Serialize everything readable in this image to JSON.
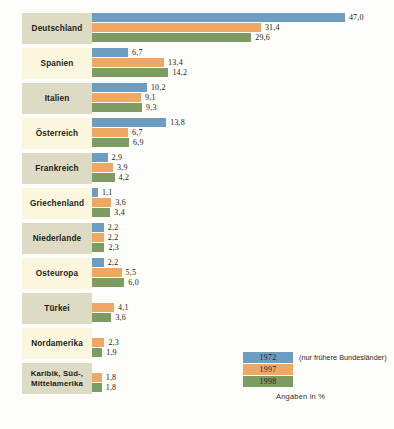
{
  "chart_data": {
    "type": "bar",
    "orientation": "horizontal",
    "title": "",
    "xlabel": "",
    "ylabel": "",
    "unit_note": "Angaben in %",
    "legend_position": "bottom-right",
    "grid": false,
    "xlim": [
      0,
      47
    ],
    "categories": [
      "Deutschland",
      "Spanien",
      "Italien",
      "Österreich",
      "Frankreich",
      "Griechenland",
      "Niederlande",
      "Osteuropa",
      "Türkei",
      "Nordamerika",
      "Karibik, Süd-, Mittelamerika"
    ],
    "series": [
      {
        "name": "1972",
        "color": "#6e9dc2",
        "values": [
          47.0,
          6.7,
          10.2,
          13.8,
          2.9,
          1.1,
          2.2,
          2.2,
          null,
          null,
          null
        ],
        "labels": [
          "47,0",
          "6,7",
          "10,2",
          "13,8",
          "2,9",
          "1,1",
          "2,2",
          "2,2",
          "",
          "",
          ""
        ]
      },
      {
        "name": "1997",
        "color": "#efa863",
        "values": [
          31.4,
          13.4,
          9.1,
          6.7,
          3.9,
          3.6,
          2.2,
          5.5,
          4.1,
          2.3,
          1.8
        ],
        "labels": [
          "31,4",
          "13,4",
          "9,1",
          "6,7",
          "3,9",
          "3,6",
          "2,2",
          "5,5",
          "4,1",
          "2,3",
          "1,8"
        ]
      },
      {
        "name": "1998",
        "color": "#7d9c62",
        "values": [
          29.6,
          14.2,
          9.3,
          6.9,
          4.2,
          3.4,
          2.3,
          6.0,
          3.6,
          1.9,
          1.8
        ],
        "labels": [
          "29,6",
          "14,2",
          "9,3",
          "6,9",
          "4,2",
          "3,4",
          "2,3",
          "6,0",
          "3,6",
          "1,9",
          "1,8"
        ]
      }
    ]
  },
  "rows": [
    {
      "label": "Deutschland",
      "two_line": false,
      "bars": [
        {
          "series": "1972",
          "value": 47.0,
          "label": "47,0"
        },
        {
          "series": "1997",
          "value": 31.4,
          "label": "31,4"
        },
        {
          "series": "1998",
          "value": 29.6,
          "label": "29,6"
        }
      ]
    },
    {
      "label": "Spanien",
      "two_line": false,
      "bars": [
        {
          "series": "1972",
          "value": 6.7,
          "label": "6,7"
        },
        {
          "series": "1997",
          "value": 13.4,
          "label": "13,4"
        },
        {
          "series": "1998",
          "value": 14.2,
          "label": "14,2"
        }
      ]
    },
    {
      "label": "Italien",
      "two_line": false,
      "bars": [
        {
          "series": "1972",
          "value": 10.2,
          "label": "10,2"
        },
        {
          "series": "1997",
          "value": 9.1,
          "label": "9,1"
        },
        {
          "series": "1998",
          "value": 9.3,
          "label": "9,3"
        }
      ]
    },
    {
      "label": "Österreich",
      "two_line": false,
      "bars": [
        {
          "series": "1972",
          "value": 13.8,
          "label": "13,8"
        },
        {
          "series": "1997",
          "value": 6.7,
          "label": "6,7"
        },
        {
          "series": "1998",
          "value": 6.9,
          "label": "6,9"
        }
      ]
    },
    {
      "label": "Frankreich",
      "two_line": false,
      "bars": [
        {
          "series": "1972",
          "value": 2.9,
          "label": "2,9"
        },
        {
          "series": "1997",
          "value": 3.9,
          "label": "3,9"
        },
        {
          "series": "1998",
          "value": 4.2,
          "label": "4,2"
        }
      ]
    },
    {
      "label": "Griechenland",
      "two_line": false,
      "bars": [
        {
          "series": "1972",
          "value": 1.1,
          "label": "1,1"
        },
        {
          "series": "1997",
          "value": 3.6,
          "label": "3,6"
        },
        {
          "series": "1998",
          "value": 3.4,
          "label": "3,4"
        }
      ]
    },
    {
      "label": "Niederlande",
      "two_line": false,
      "bars": [
        {
          "series": "1972",
          "value": 2.2,
          "label": "2,2"
        },
        {
          "series": "1997",
          "value": 2.2,
          "label": "2,2"
        },
        {
          "series": "1998",
          "value": 2.3,
          "label": "2,3"
        }
      ]
    },
    {
      "label": "Osteuropa",
      "two_line": false,
      "bars": [
        {
          "series": "1972",
          "value": 2.2,
          "label": "2,2"
        },
        {
          "series": "1997",
          "value": 5.5,
          "label": "5,5"
        },
        {
          "series": "1998",
          "value": 6.0,
          "label": "6,0"
        }
      ]
    },
    {
      "label": "Türkei",
      "two_line": false,
      "bars": [
        {
          "series": "1972",
          "value": null,
          "label": ""
        },
        {
          "series": "1997",
          "value": 4.1,
          "label": "4,1"
        },
        {
          "series": "1998",
          "value": 3.6,
          "label": "3,6"
        }
      ]
    },
    {
      "label": "Nordamerika",
      "two_line": false,
      "bars": [
        {
          "series": "1972",
          "value": null,
          "label": ""
        },
        {
          "series": "1997",
          "value": 2.3,
          "label": "2,3"
        },
        {
          "series": "1998",
          "value": 1.9,
          "label": "1,9"
        }
      ]
    },
    {
      "label": "Karibik, Süd-,\nMittelamerika",
      "two_line": true,
      "bars": [
        {
          "series": "1972",
          "value": null,
          "label": ""
        },
        {
          "series": "1997",
          "value": 1.8,
          "label": "1,8"
        },
        {
          "series": "1998",
          "value": 1.8,
          "label": "1,8"
        }
      ]
    }
  ],
  "legend": {
    "entries": [
      {
        "year": "1972",
        "color": "#6e9dc2",
        "note": "(nur frühere Bundesländer)"
      },
      {
        "year": "1997",
        "color": "#efa863",
        "note": ""
      },
      {
        "year": "1998",
        "color": "#7d9c62",
        "note": ""
      }
    ],
    "footnote": "Angaben in %"
  },
  "style": {
    "color_1972": "#6e9dc2",
    "color_1997": "#efa863",
    "color_1998": "#7d9c62",
    "label_tint_a": "#dddbc4",
    "label_tint_b": "#faf7de",
    "background": "#fdfdfa",
    "px_per_unit": 5.38
  }
}
